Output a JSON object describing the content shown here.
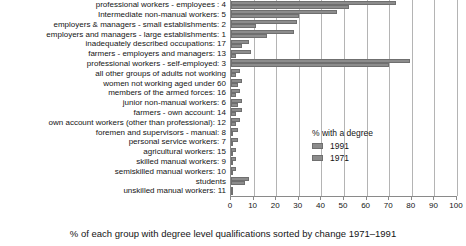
{
  "chart_data": {
    "type": "bar",
    "orientation": "horizontal",
    "title": "",
    "xlabel": "% of each group with degree level qualifications sorted by change 1971–1991",
    "ylabel": "",
    "xlim": [
      0,
      100
    ],
    "xticks": [
      0,
      10,
      20,
      30,
      40,
      50,
      60,
      70,
      80,
      90,
      100
    ],
    "grid": true,
    "legend": {
      "title": "% with a degree",
      "position": "inside-right",
      "entries": [
        "1991",
        "1971"
      ]
    },
    "categories": [
      "professional workers - employees :  4",
      "Intermediate non-manual workers:  5",
      "employers & managers - small establishments:  2",
      "employers and managers - large establishments:  1",
      "inadequately  described occupations: 17",
      "farmers - employers and managers: 13",
      "professional workers - self-employed:  3",
      "all other groups of adults not working",
      "women not working aged under 60",
      "members of the armed forces: 16",
      "junior non-manual workers:  6",
      "farmers - own account: 14",
      "own account workers (other than professional): 12",
      "foremen and supervisors - manual:  8",
      "personal service workers:  7",
      "agricultural workers: 15",
      "skilled manual workers:  9",
      "semiskilled manual workers: 10",
      "students",
      "unskilled manual workers: 11"
    ],
    "series": [
      {
        "name": "1991",
        "color": "#8c8c8c",
        "values": [
          73,
          47,
          29,
          28,
          8,
          9,
          79,
          4,
          5,
          4,
          5,
          5,
          4,
          3,
          3,
          2,
          2,
          2,
          8,
          1
        ]
      },
      {
        "name": "1971",
        "color": "#8c8c8c",
        "values": [
          52,
          30,
          11,
          16,
          5,
          2,
          70,
          2,
          3,
          2,
          3,
          2,
          2,
          1,
          1,
          1,
          1,
          1,
          6,
          0.5
        ]
      }
    ]
  }
}
